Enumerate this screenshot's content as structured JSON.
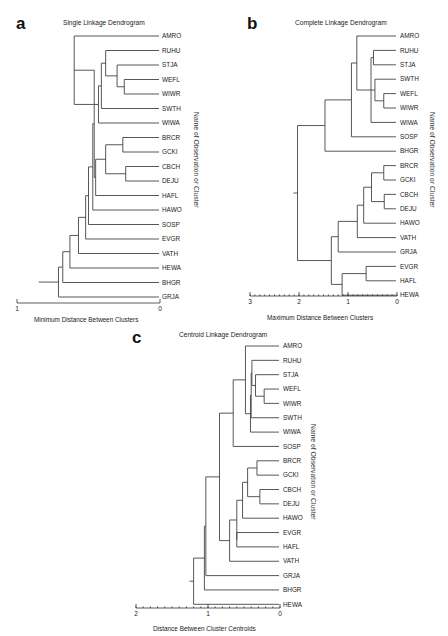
{
  "chart_data": [
    {
      "type": "dendrogram",
      "panel": "a",
      "title": "Single Linkage Dendrogram",
      "xlabel": "Minimum Distance Between Clusters",
      "ylabel": "Name of Observation or Cluster",
      "xlim": [
        1,
        0
      ],
      "ticks": [
        {
          "value": 1,
          "label": "1"
        },
        {
          "value": 0,
          "label": "0"
        }
      ],
      "minor_ticks": false,
      "leaves": [
        "AMRO",
        "RUHU",
        "STJA",
        "WEFL",
        "WIWR",
        "SWTH",
        "WIWA",
        "BRCR",
        "GCKI",
        "CBCH",
        "DEJU",
        "HAFL",
        "HAWO",
        "SOSP",
        "EVGR",
        "VATH",
        "HEWA",
        "BHGR",
        "GRJA"
      ],
      "tree": {
        "h": 0.82,
        "c": [
          {
            "h": 0.71,
            "c": [
              {
                "h": 0.68,
                "c": [
                  {
                    "h": 0.63,
                    "c": [
                      {
                        "h": 0.57,
                        "c": [
                          {
                            "h": 0.52,
                            "c": [
                              {
                                "h": 0.5,
                                "c": [
                                  {
                                    "h": 0.47,
                                    "c": [
                                      {
                                        "h": 0.46,
                                        "c": [
                                          {
                                            "h": 0.6,
                                            "c": [
                                              {
                                                "h": 0.6,
                                                "c": [
                                                  "AMRO",
                                                  {
                                                    "h": 0.43,
                                                    "c": [
                                                      {
                                                        "h": 0.41,
                                                        "c": [
                                                          {
                                                            "h": 0.38,
                                                            "c": [
                                                              "RUHU",
                                                              {
                                                                "h": 0.3,
                                                                "c": [
                                                                  "STJA",
                                                                  {
                                                                    "h": 0.25,
                                                                    "c": [
                                                                      "WEFL",
                                                                      "WIWR"
                                                                    ]
                                                                  }
                                                                ]
                                                              }
                                                            ]
                                                          },
                                                          "SWTH"
                                                        ]
                                                      },
                                                      "WIWA"
                                                    ]
                                                  }
                                                ]
                                              }
                                            ]
                                          },
                                          {
                                            "h": 0.45,
                                            "c": [
                                              {
                                                "h": 0.38,
                                                "c": [
                                                  {
                                                    "h": 0.26,
                                                    "c": [
                                                      "BRCR",
                                                      "GCKI"
                                                    ]
                                                  },
                                                  {
                                                    "h": 0.24,
                                                    "c": [
                                                      "CBCH",
                                                      "DEJU"
                                                    ]
                                                  }
                                                ]
                                              },
                                              "HAFL"
                                            ]
                                          }
                                        ]
                                      },
                                      "HAWO"
                                    ]
                                  },
                                  "SOSP"
                                ]
                              },
                              "EVGR"
                            ]
                          },
                          "VATH"
                        ]
                      },
                      "HEWA"
                    ]
                  },
                  "BHGR"
                ]
              },
              "GRJA"
            ]
          }
        ]
      }
    },
    {
      "type": "dendrogram",
      "panel": "b",
      "title": "Complete Linkage Dendrogram",
      "xlabel": "Maximum Distance Between Clusters",
      "ylabel": "Name of Observation or Cluster",
      "xlim": [
        3,
        0
      ],
      "ticks": [
        {
          "value": 3,
          "label": "3"
        },
        {
          "value": 2,
          "label": "2"
        },
        {
          "value": 1,
          "label": "1"
        },
        {
          "value": 0,
          "label": "0"
        }
      ],
      "minor_ticks": true,
      "leaves": [
        "AMRO",
        "RUHU",
        "STJA",
        "SWTH",
        "WEFL",
        "WIWR",
        "WIWA",
        "SOSP",
        "BHGR",
        "BRCR",
        "GCKI",
        "CBCH",
        "DEJU",
        "HAWO",
        "VATH",
        "GRJA",
        "EVGR",
        "HAFL",
        "HEWA"
      ],
      "tree": {
        "h": 2.03,
        "c": [
          {
            "h": 1.47,
            "c": [
              {
                "h": 0.93,
                "c": [
                  {
                    "h": 0.82,
                    "c": [
                      "AMRO",
                      {
                        "h": 0.53,
                        "c": [
                          {
                            "h": 0.48,
                            "c": [
                              "RUHU",
                              "STJA"
                            ]
                          },
                          {
                            "h": 0.45,
                            "c": [
                              "SWTH",
                              {
                                "h": 0.27,
                                "c": [
                                  "WEFL",
                                  "WIWR"
                                ]
                              }
                            ]
                          },
                          "WIWA"
                        ]
                      }
                    ]
                  },
                  "SOSP"
                ]
              },
              "BHGR"
            ]
          },
          {
            "h": 1.34,
            "c": [
              {
                "h": 1.2,
                "c": [
                  {
                    "h": 0.81,
                    "c": [
                      {
                        "h": 0.68,
                        "c": [
                          {
                            "h": 0.52,
                            "c": [
                              {
                                "h": 0.27,
                                "c": [
                                  "BRCR",
                                  "GCKI"
                                ]
                              },
                              {
                                "h": 0.26,
                                "c": [
                                  "CBCH",
                                  "DEJU"
                                ]
                              }
                            ]
                          },
                          "HAWO"
                        ]
                      },
                      "VATH"
                    ]
                  },
                  "GRJA"
                ]
              },
              {
                "h": 1.12,
                "c": [
                  {
                    "h": 0.63,
                    "c": [
                      "EVGR",
                      "HAFL"
                    ]
                  },
                  "HEWA"
                ]
              }
            ]
          }
        ]
      }
    },
    {
      "type": "dendrogram",
      "panel": "c",
      "title": "Centroid Linkage Dendrogram",
      "xlabel": "Distance Between Cluster Centroids",
      "ylabel": "Name of Observation or Cluster",
      "xlim": [
        2,
        0
      ],
      "ticks": [
        {
          "value": 2,
          "label": "2"
        },
        {
          "value": 1,
          "label": "1"
        },
        {
          "value": 0,
          "label": "0"
        }
      ],
      "minor_ticks": true,
      "leaves": [
        "AMRO",
        "RUHU",
        "STJA",
        "WEFL",
        "WIWR",
        "SWTH",
        "WIWA",
        "SOSP",
        "BRCR",
        "GCKI",
        "CBCH",
        "DEJU",
        "HAWO",
        "EVGR",
        "HAFL",
        "VATH",
        "GRJA",
        "BHGR",
        "HEWA"
      ],
      "tree": {
        "h": 1.2,
        "c": [
          {
            "h": 1.05,
            "c": [
              {
                "h": 1.03,
                "c": [
                  {
                    "h": 0.84,
                    "c": [
                      {
                        "h": 0.65,
                        "c": [
                          {
                            "h": 0.48,
                            "c": [
                              "AMRO",
                              {
                                "h": 0.41,
                                "c": [
                                  {
                                    "h": 0.4,
                                    "c": [
                                      {
                                        "h": 0.39,
                                        "c": [
                                          "RUHU",
                                          {
                                            "h": 0.34,
                                            "c": [
                                              "STJA",
                                              {
                                                "h": 0.22,
                                                "c": [
                                                  "WEFL",
                                                  "WIWR"
                                                ]
                                              }
                                            ]
                                          }
                                        ]
                                      },
                                      "SWTH"
                                    ]
                                  },
                                  "WIWA"
                                ]
                              }
                            ]
                          },
                          "SOSP"
                        ]
                      },
                      {
                        "h": 0.7,
                        "c": [
                          {
                            "h": 0.6,
                            "c": [
                              {
                                "h": 0.52,
                                "c": [
                                  {
                                    "h": 0.45,
                                    "c": [
                                      {
                                        "h": 0.32,
                                        "c": [
                                          "BRCR",
                                          "GCKI"
                                        ]
                                      },
                                      {
                                        "h": 0.28,
                                        "c": [
                                          "CBCH",
                                          "DEJU"
                                        ]
                                      }
                                    ]
                                  },
                                  "HAWO"
                                ]
                              },
                              {
                                "h": 0.6,
                                "c": [
                                  "EVGR",
                                  "HAFL"
                                ]
                              }
                            ]
                          },
                          "VATH"
                        ]
                      }
                    ]
                  },
                  "GRJA"
                ]
              },
              "BHGR"
            ]
          },
          "HEWA"
        ]
      }
    }
  ],
  "panels": {
    "a": {
      "letter": "a",
      "title": "Single Linkage Dendrogram",
      "xlabel": "Minimum Distance Between Clusters",
      "side_label": "Name of Observation or Cluster"
    },
    "b": {
      "letter": "b",
      "title": "Complete Linkage Dendrogram",
      "xlabel": "Maximum Distance Between Clusters",
      "side_label": "Name of Observation or Cluster"
    },
    "c": {
      "letter": "c",
      "title": "Centroid Linkage Dendrogram",
      "xlabel": "Distance Between Cluster Centroids",
      "side_label": "Name of Observation or Cluster"
    }
  }
}
